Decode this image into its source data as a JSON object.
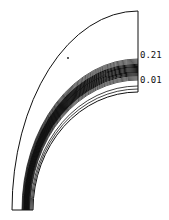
{
  "chart_data": {
    "type": "contour",
    "title": "",
    "xlabel": "",
    "ylabel": "",
    "domain_shape": "quarter annulus (curved channel)",
    "grid": false,
    "legend": "none",
    "contour_labels": [
      {
        "text": "0.21",
        "position": "right edge, upper end of contour band"
      },
      {
        "text": "0.01",
        "position": "right edge, lower end of contour band"
      }
    ],
    "contour_range": [
      0.01,
      0.21
    ],
    "contour_step": 0.01,
    "contour_count": 21
  },
  "labels": {
    "upper": "0.21",
    "lower": "0.01"
  },
  "colors": {
    "line": "#111111",
    "background": "#ffffff"
  }
}
